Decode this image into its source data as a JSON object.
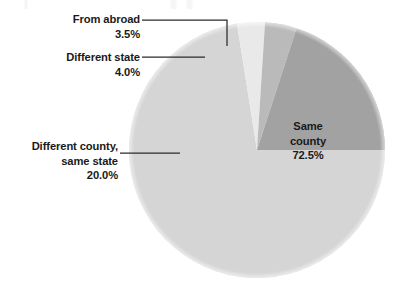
{
  "chart_data": {
    "type": "pie",
    "title": "",
    "subtitle": "",
    "xlabel": "",
    "ylabel": "",
    "grid": false,
    "legend_position": "none",
    "label_format": "percent-one-decimal",
    "categories": [
      "Same county",
      "Different county, same state",
      "Different state",
      "From abroad"
    ],
    "values": [
      72.5,
      20.0,
      4.0,
      3.5
    ],
    "value_labels": [
      "72.5%",
      "20.0%",
      "4.0%",
      "3.5%"
    ],
    "colors": [
      "#d5d5d5",
      "#a2a2a2",
      "#bababa",
      "#e9e9e9"
    ],
    "slices": [
      {
        "name": "Same county",
        "label_line1": "Same",
        "label_line2": "county",
        "value": 72.5,
        "value_label": "72.5%",
        "color": "#d5d5d5",
        "label_placement": "inside"
      },
      {
        "name": "Different county, same state",
        "label_line1": "Different county,",
        "label_line2": "same state",
        "value": 20.0,
        "value_label": "20.0%",
        "color": "#a2a2a2",
        "label_placement": "outside-left"
      },
      {
        "name": "Different state",
        "label_line1": "Different state",
        "label_line2": "",
        "value": 4.0,
        "value_label": "4.0%",
        "color": "#bababa",
        "label_placement": "outside-left"
      },
      {
        "name": "From abroad",
        "label_line1": "From abroad",
        "label_line2": "",
        "value": 3.5,
        "value_label": "3.5%",
        "color": "#e9e9e9",
        "label_placement": "outside-left"
      }
    ]
  },
  "callouts": {
    "from_abroad": {
      "label": "From abroad",
      "value": "3.5%"
    },
    "different_state": {
      "label": "Different state",
      "value": "4.0%"
    },
    "different_county": {
      "label_line1": "Different county,",
      "label_line2": "same state",
      "value": "20.0%"
    },
    "same_county": {
      "label_line1": "Same",
      "label_line2": "county",
      "value": "72.5%"
    }
  }
}
